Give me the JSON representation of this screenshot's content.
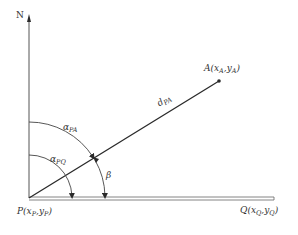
{
  "diagram": {
    "type": "surveying-azimuth-diagram",
    "colors": {
      "line": "#2a2a2a",
      "axis": "#555555",
      "text": "#333333",
      "background": "#ffffff"
    },
    "labels": {
      "north": "N",
      "point_a": {
        "name": "A",
        "open": "(",
        "x": "x",
        "x_sub": "A",
        "sep": ",",
        "y": "y",
        "y_sub": "A",
        "close": ")"
      },
      "point_p": {
        "name": "P",
        "open": "(",
        "x": "x",
        "x_sub": "P",
        "sep": ",",
        "y": "y",
        "y_sub": "P",
        "close": ")"
      },
      "point_q": {
        "name": "Q",
        "open": "(",
        "x": "x",
        "x_sub": "Q",
        "sep": ",",
        "y": "y",
        "y_sub": "Q",
        "close": ")"
      },
      "distance": {
        "base": "d",
        "sub": "PA"
      },
      "alpha_pa": {
        "base": "α",
        "sub": "PA"
      },
      "alpha_pq": {
        "base": "α",
        "sub": "PQ"
      },
      "beta": "β"
    },
    "geometry": {
      "origin_P": [
        29,
        198
      ],
      "north_top": [
        29,
        15
      ],
      "point_A": [
        219,
        81
      ],
      "q_end": [
        274,
        198
      ],
      "arc_alpha_pq_radius": 43,
      "arc_alpha_pa_radius": 76
    }
  }
}
